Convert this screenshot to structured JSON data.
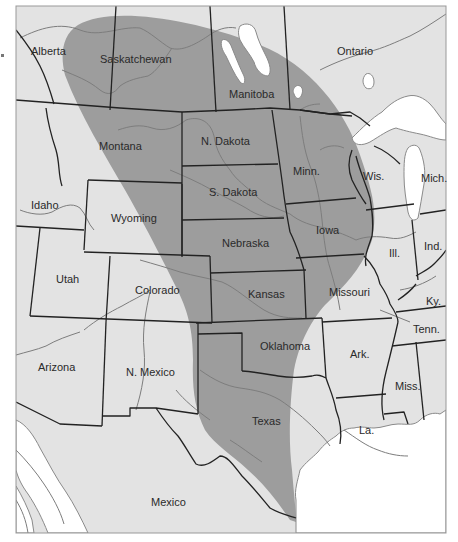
{
  "map": {
    "title": "",
    "colors": {
      "land": "#e3e3e3",
      "range_shading": "#9d9d9d",
      "water": "#ffffff",
      "border": "#222222",
      "river": "#7d7d7d"
    },
    "shaded_region": "Great Plains range (Alberta/Saskatchewan south to Texas)",
    "labels": {
      "alberta": "Alberta",
      "saskatchewan": "Saskatchewan",
      "manitoba": "Manitoba",
      "ontario": "Ontario",
      "montana": "Montana",
      "n_dakota": "N. Dakota",
      "s_dakota": "S. Dakota",
      "minn": "Minn.",
      "wis": "Wis.",
      "mich": "Mich.",
      "idaho": "Idaho",
      "wyoming": "Wyoming",
      "nebraska": "Nebraska",
      "iowa": "Iowa",
      "ill": "Ill.",
      "ind": "Ind.",
      "utah": "Utah",
      "colorado": "Colorado",
      "kansas": "Kansas",
      "missouri": "Missouri",
      "ky": "Ky.",
      "tenn": "Tenn.",
      "arizona": "Arizona",
      "n_mexico": "N. Mexico",
      "oklahoma": "Oklahoma",
      "ark": "Ark.",
      "miss": "Miss.",
      "texas": "Texas",
      "la": "La.",
      "mexico": "Mexico"
    }
  }
}
